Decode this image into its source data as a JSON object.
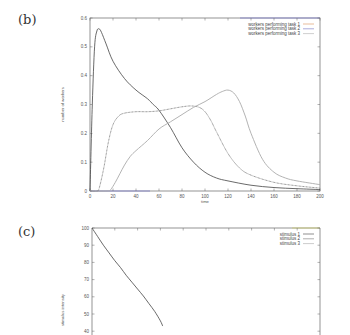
{
  "panels": [
    {
      "label": "(b)"
    },
    {
      "label": "(c)"
    }
  ],
  "chart_data": [
    {
      "type": "line",
      "panel": "(b)",
      "title": "",
      "xlabel": "time",
      "ylabel": "number of workers",
      "xlim": [
        0,
        200
      ],
      "ylim": [
        0,
        0.6
      ],
      "xticks": [
        "0",
        "20",
        "40",
        "60",
        "80",
        "100",
        "120",
        "140",
        "160",
        "180",
        "200"
      ],
      "yticks": [
        "0",
        "0.1",
        "0.2",
        "0.3",
        "0.4",
        "0.5",
        "0.6"
      ],
      "legend_position": "top-right",
      "grid": false,
      "series": [
        {
          "name": "workers performing task 1",
          "color": "#444444",
          "x": [
            0,
            2,
            4,
            6,
            8,
            10,
            14,
            20,
            30,
            40,
            50,
            55,
            60,
            70,
            80,
            90,
            100,
            110,
            120,
            140,
            160,
            180,
            200
          ],
          "values": [
            0,
            0.3,
            0.5,
            0.555,
            0.562,
            0.55,
            0.51,
            0.45,
            0.39,
            0.35,
            0.32,
            0.3,
            0.28,
            0.22,
            0.15,
            0.1,
            0.065,
            0.045,
            0.035,
            0.02,
            0.012,
            0.008,
            0.005
          ]
        },
        {
          "name": "workers performing task 2",
          "color": "#666666",
          "x": [
            0,
            6,
            8,
            12,
            16,
            20,
            25,
            30,
            40,
            50,
            60,
            70,
            80,
            88,
            95,
            100,
            105,
            110,
            120,
            130,
            140,
            160,
            180,
            200
          ],
          "values": [
            0,
            0,
            0.01,
            0.08,
            0.17,
            0.23,
            0.26,
            0.27,
            0.275,
            0.275,
            0.278,
            0.285,
            0.292,
            0.295,
            0.29,
            0.275,
            0.245,
            0.205,
            0.13,
            0.08,
            0.055,
            0.03,
            0.018,
            0.01
          ]
        },
        {
          "name": "workers performing task 3",
          "color": "#aaaaaa",
          "x": [
            0,
            15,
            18,
            22,
            26,
            30,
            35,
            40,
            50,
            60,
            70,
            80,
            90,
            100,
            110,
            115,
            120,
            125,
            130,
            135,
            140,
            150,
            160,
            170,
            180,
            200
          ],
          "values": [
            0,
            0,
            0.005,
            0.03,
            0.06,
            0.09,
            0.12,
            0.14,
            0.175,
            0.215,
            0.24,
            0.265,
            0.29,
            0.31,
            0.335,
            0.345,
            0.35,
            0.34,
            0.31,
            0.26,
            0.2,
            0.11,
            0.065,
            0.045,
            0.035,
            0.022
          ]
        }
      ]
    },
    {
      "type": "line",
      "panel": "(c)",
      "title": "",
      "xlabel": "",
      "ylabel": "stimulus intensity",
      "xlim": [
        0,
        200
      ],
      "ylim_visible": [
        40,
        100
      ],
      "yticks": [
        "40",
        "50",
        "60",
        "70",
        "80",
        "90",
        "100"
      ],
      "legend_position": "top-right",
      "grid": false,
      "series": [
        {
          "name": "stimulus 1",
          "color": "#444444",
          "x": [
            0,
            5,
            10,
            15,
            20,
            25,
            30,
            35,
            40,
            45,
            50,
            55,
            60,
            62
          ],
          "values": [
            100,
            95,
            90,
            85.5,
            81,
            77,
            72.5,
            68.5,
            64.5,
            60.5,
            56,
            51.5,
            46,
            43
          ]
        },
        {
          "name": "stimulus 2",
          "color": "#777777",
          "x": [],
          "values": []
        },
        {
          "name": "stimulus 3",
          "color": "#aaaaaa",
          "x": [],
          "values": []
        }
      ]
    }
  ]
}
